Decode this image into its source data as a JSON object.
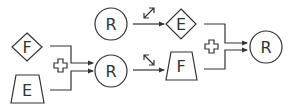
{
  "diagram": {
    "colors": {
      "stroke": "#333333",
      "background": "#ffffff"
    },
    "nodes": {
      "left_diamond": {
        "shape": "diamond",
        "label": "F"
      },
      "left_trapezoid": {
        "shape": "trapezoid",
        "label": "E"
      },
      "middle_circle": {
        "shape": "circle",
        "label": "R"
      },
      "top_circle": {
        "shape": "circle",
        "label": "R"
      },
      "right_diamond": {
        "shape": "diamond",
        "label": "E"
      },
      "right_trapezoid": {
        "shape": "trapezoid",
        "label": "F"
      },
      "final_circle": {
        "shape": "circle",
        "label": "R"
      }
    },
    "operators": {
      "left_plus": {
        "icon": "plus-outline-icon"
      },
      "right_plus": {
        "icon": "plus-outline-icon"
      }
    },
    "transforms": {
      "top": {
        "icon": "expand-diagonal-icon",
        "from": "top_circle",
        "to": "right_diamond"
      },
      "bottom": {
        "icon": "shrink-diagonal-icon",
        "from": "middle_circle",
        "to": "right_trapezoid"
      }
    },
    "edges": [
      {
        "from": "left_diamond",
        "to": "middle_circle",
        "via": "left_plus"
      },
      {
        "from": "left_trapezoid",
        "to": "middle_circle",
        "via": "left_plus"
      },
      {
        "from": "top_circle",
        "to": "right_diamond"
      },
      {
        "from": "middle_circle",
        "to": "right_trapezoid"
      },
      {
        "from": "right_diamond",
        "to": "final_circle",
        "via": "right_plus"
      },
      {
        "from": "right_trapezoid",
        "to": "final_circle",
        "via": "right_plus"
      }
    ]
  }
}
